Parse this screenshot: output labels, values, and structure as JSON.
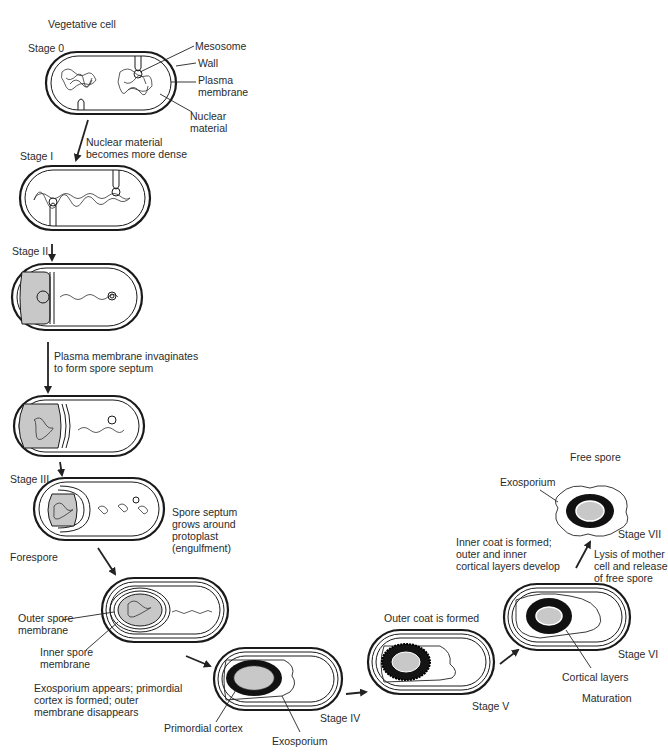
{
  "title": "Vegetative cell",
  "stages": {
    "stage0": {
      "label": "Stage 0",
      "callouts": [
        "Mesosome",
        "Wall",
        "Plasma\nmembrane",
        "Nuclear\nmaterial"
      ]
    },
    "stage1": {
      "label": "Stage I",
      "transition_note": "Nuclear material\nbecomes more dense"
    },
    "stage2": {
      "label": "Stage II",
      "transition_note": "Plasma membrane invaginates\nto form spore septum"
    },
    "stage3": {
      "label": "Stage III",
      "side_note": "Spore septum\ngrows around\nprotoplast\n(engulfment)",
      "bottom_label": "Forespore"
    },
    "forespore_cell": {
      "callouts": [
        "Outer spore\nmembrane",
        "Inner spore\nmembrane"
      ],
      "transition_note": "Exosporium appears; primordial\ncortex is formed; outer\nmembrane disappears"
    },
    "stage4": {
      "label": "Stage IV",
      "callouts": [
        "Primordial cortex",
        "Exosporium"
      ]
    },
    "stage5": {
      "label": "Stage V",
      "transition_note": "Outer coat is formed"
    },
    "stage6": {
      "label": "Stage VI",
      "callouts": [
        "Cortical layers"
      ],
      "transition_note": "Inner coat is formed;\nouter and inner\ncortical layers develop",
      "phase_label": "Maturation"
    },
    "stage7": {
      "label": "Stage VII",
      "title": "Free spore",
      "callouts": [
        "Exosporium"
      ],
      "transition_note": "Lysis of mother\ncell and release\nof free spore"
    }
  },
  "colors": {
    "line": "#1a1a1a",
    "forespore_fill": "#c8c8c8",
    "cortex_fill": "#111111",
    "core_fill": "#bdbdbd",
    "background": "#ffffff"
  }
}
